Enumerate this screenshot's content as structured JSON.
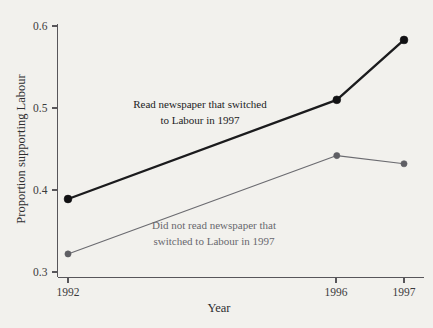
{
  "chart_data": {
    "type": "line",
    "title": "",
    "xlabel": "Year",
    "ylabel": "Proportion supporting Labour",
    "x": [
      "1992",
      "1996",
      "1997"
    ],
    "x_positions": [
      1992,
      1996,
      1997
    ],
    "xlim": [
      1992,
      1997
    ],
    "ylim": [
      0.3,
      0.6
    ],
    "yticks": [
      "0.3",
      "0.4",
      "0.5",
      "0.6"
    ],
    "ytick_values": [
      0.3,
      0.4,
      0.5,
      0.6
    ],
    "xticks": [
      "1992",
      "1996",
      "1997"
    ],
    "grid": false,
    "legend": "inline-annotations",
    "series": [
      {
        "name": "Read newspaper that switched to Labour in 1997",
        "label_line1": "Read newspaper that switched",
        "label_line2": "to Labour in 1997",
        "color": "#1b1b1d",
        "values": [
          0.389,
          0.51,
          0.583
        ]
      },
      {
        "name": "Did not read newspaper that switched to Labour in 1997",
        "label_line1": "Did not read newspaper that",
        "label_line2": "switched to Labour in 1997",
        "color": "#6b6b70",
        "values": [
          0.322,
          0.442,
          0.432
        ]
      }
    ]
  },
  "figure": {
    "background": "#f2f1ed",
    "axis_color": "#58565a"
  }
}
